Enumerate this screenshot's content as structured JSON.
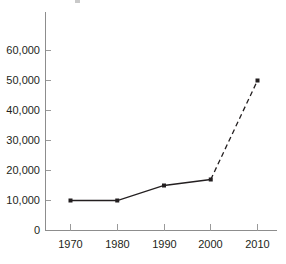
{
  "chart_data": {
    "type": "line",
    "title": "",
    "subtitle": "",
    "xlabel": "",
    "ylabel": "",
    "x": [
      1970,
      1980,
      1990,
      2000,
      2010
    ],
    "categories": [
      "1970",
      "1980",
      "1990",
      "2000",
      "2010"
    ],
    "values": [
      10000,
      10000,
      15000,
      17000,
      50000
    ],
    "series": [
      {
        "name": "",
        "x": [
          1970,
          1980,
          1990,
          2000,
          2010
        ],
        "values": [
          10000,
          10000,
          15000,
          17000,
          50000
        ],
        "segments": [
          {
            "style": "solid",
            "from": 1970,
            "to": 2000
          },
          {
            "style": "dashed",
            "from": 2000,
            "to": 2010
          }
        ],
        "marker": "square",
        "color": "#231f20"
      }
    ],
    "xlim": [
      1965,
      2015
    ],
    "ylim": [
      0,
      60000
    ],
    "y_ticks": [
      0,
      10000,
      20000,
      30000,
      40000,
      50000,
      60000
    ],
    "y_tick_labels": [
      "0",
      "10,000",
      "20,000",
      "30,000",
      "40,000",
      "50,000",
      "60,000"
    ],
    "x_ticks": [
      1970,
      1980,
      1990,
      2000,
      2010
    ],
    "x_tick_labels": [
      "1970",
      "1980",
      "1990",
      "2000",
      "2010"
    ],
    "grid": false,
    "legend": null,
    "legend_position": "none",
    "annotations": [],
    "colors": {
      "series": "#231f20",
      "axis": "#8d8d8d",
      "tick": "#9a9a9a",
      "text": "#231f20",
      "background": "#ffffff"
    }
  },
  "axis": {
    "y_labels": {
      "t0": "0",
      "t1": "10,000",
      "t2": "20,000",
      "t3": "30,000",
      "t4": "40,000",
      "t5": "50,000",
      "t6": "60,000"
    },
    "x_labels": {
      "t0": "1970",
      "t1": "1980",
      "t2": "1990",
      "t3": "2000",
      "t4": "2010"
    }
  }
}
